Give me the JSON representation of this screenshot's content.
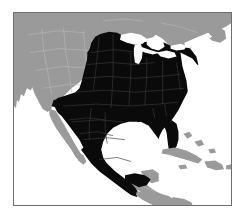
{
  "figure": {
    "kind": "distribution-range-map",
    "region": "North America",
    "projection_hint": "conic, continental North America framed by thin rule",
    "frame": {
      "border_color": "#6e6e70",
      "border_width_px": 1,
      "x": 13,
      "y": 12,
      "width": 219,
      "height": 194
    }
  },
  "legend": {
    "visible": false,
    "entries": [
      {
        "key": "in-range",
        "label": "Range (present)",
        "color": "#0a0a0a"
      },
      {
        "key": "out-of-range",
        "label": "Land outside range",
        "color": "#9a9a9a"
      },
      {
        "key": "water",
        "label": "Water",
        "color": "#ffffff"
      }
    ]
  },
  "colors": {
    "page_background": "#ffffff",
    "water": "#ffffff",
    "land_out_of_range": "#9a9a9a",
    "land_in_range": "#0a0a0a",
    "subdivision_line_out": "#b5b5b5",
    "subdivision_line_in": "#3a3a3a",
    "frame": "#6e6e70"
  },
  "chart_data": {
    "type": "map",
    "xlabel": "",
    "ylabel": "",
    "grid": false,
    "legend_position": "none",
    "encoding": {
      "fill_in_range": "#0a0a0a",
      "fill_out_of_range": "#9a9a9a",
      "fill_water": "#ffffff"
    },
    "categories": [
      "in-range",
      "out-of-range",
      "water"
    ],
    "values": [
      2,
      1,
      0
    ],
    "regions": [
      {
        "name": "Mexico (mainland)",
        "status": "in-range"
      },
      {
        "name": "Baja California",
        "status": "out-of-range"
      },
      {
        "name": "Texas",
        "status": "in-range"
      },
      {
        "name": "Oklahoma",
        "status": "in-range"
      },
      {
        "name": "Kansas",
        "status": "in-range"
      },
      {
        "name": "Nebraska",
        "status": "in-range"
      },
      {
        "name": "South Dakota",
        "status": "in-range"
      },
      {
        "name": "North Dakota",
        "status": "in-range"
      },
      {
        "name": "Minnesota",
        "status": "in-range"
      },
      {
        "name": "Iowa",
        "status": "in-range"
      },
      {
        "name": "Missouri",
        "status": "in-range"
      },
      {
        "name": "Arkansas",
        "status": "in-range"
      },
      {
        "name": "Louisiana",
        "status": "in-range"
      },
      {
        "name": "Mississippi",
        "status": "in-range"
      },
      {
        "name": "Alabama",
        "status": "in-range"
      },
      {
        "name": "Georgia",
        "status": "in-range"
      },
      {
        "name": "Florida",
        "status": "in-range"
      },
      {
        "name": "Tennessee",
        "status": "in-range"
      },
      {
        "name": "Kentucky",
        "status": "in-range"
      },
      {
        "name": "Illinois",
        "status": "in-range"
      },
      {
        "name": "Wisconsin",
        "status": "in-range"
      },
      {
        "name": "Michigan",
        "status": "in-range"
      },
      {
        "name": "Indiana",
        "status": "in-range"
      },
      {
        "name": "Ohio",
        "status": "in-range"
      },
      {
        "name": "West Virginia",
        "status": "in-range"
      },
      {
        "name": "Virginia",
        "status": "in-range"
      },
      {
        "name": "North Carolina",
        "status": "in-range"
      },
      {
        "name": "South Carolina",
        "status": "in-range"
      },
      {
        "name": "Pennsylvania",
        "status": "in-range"
      },
      {
        "name": "New York",
        "status": "in-range"
      },
      {
        "name": "New England",
        "status": "in-range"
      },
      {
        "name": "southern Ontario",
        "status": "in-range"
      },
      {
        "name": "southern Arizona / New Mexico border strip",
        "status": "in-range"
      },
      {
        "name": "California",
        "status": "out-of-range"
      },
      {
        "name": "Oregon",
        "status": "out-of-range"
      },
      {
        "name": "Washington",
        "status": "out-of-range"
      },
      {
        "name": "Nevada",
        "status": "out-of-range"
      },
      {
        "name": "Idaho",
        "status": "out-of-range"
      },
      {
        "name": "Utah",
        "status": "out-of-range"
      },
      {
        "name": "Montana",
        "status": "out-of-range"
      },
      {
        "name": "Wyoming",
        "status": "out-of-range"
      },
      {
        "name": "Colorado",
        "status": "out-of-range"
      },
      {
        "name": "northern Arizona",
        "status": "out-of-range"
      },
      {
        "name": "Canada (most provinces)",
        "status": "out-of-range"
      },
      {
        "name": "Central America",
        "status": "out-of-range"
      },
      {
        "name": "Cuba",
        "status": "out-of-range"
      },
      {
        "name": "Hispaniola",
        "status": "out-of-range"
      },
      {
        "name": "Great Lakes",
        "status": "water"
      },
      {
        "name": "Gulf of Mexico",
        "status": "water"
      },
      {
        "name": "Atlantic Ocean",
        "status": "water"
      },
      {
        "name": "Pacific Ocean",
        "status": "water"
      }
    ]
  },
  "a11y": {
    "description": "Shaded range map of North America. The eastern and central United States plus all of mainland Mexico are filled solid black to mark the distribution range. The western United States, Canada, Central America, the Caribbean islands and Baja California are medium gray. Oceans, the Gulf of Mexico and the Great Lakes are white."
  }
}
